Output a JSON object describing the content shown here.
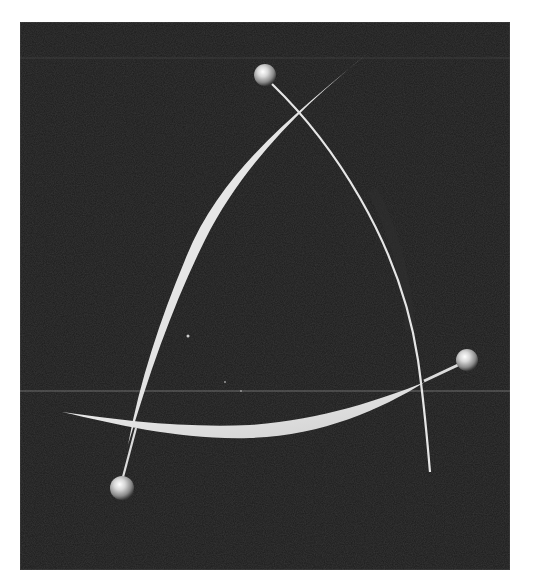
{
  "image": {
    "description": "Abstract 3D render: three glossy spheres on thin rods with crossing curved white ribbons against a dark textured background",
    "background_color": "#1c1c1c",
    "page_color": "#ffffff",
    "ribbon_color": "#e8e8e8",
    "sphere_color": "#d0d0d0"
  },
  "elements": {
    "spheres": [
      {
        "name": "sphere-top",
        "cx": 265,
        "cy": 75,
        "r": 11
      },
      {
        "name": "sphere-right",
        "cx": 467,
        "cy": 360,
        "r": 11
      },
      {
        "name": "sphere-bottom-left",
        "cx": 122,
        "cy": 488,
        "r": 12
      }
    ]
  }
}
